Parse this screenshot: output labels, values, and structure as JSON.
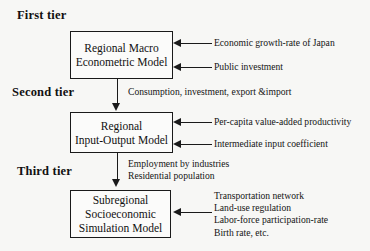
{
  "diagram": {
    "tiers": [
      {
        "id": "first",
        "label": "First tier"
      },
      {
        "id": "second",
        "label": "Second tier"
      },
      {
        "id": "third",
        "label": "Third tier"
      }
    ],
    "boxes": [
      {
        "id": "macro",
        "lines": [
          "Regional Macro",
          "Econometric Model"
        ]
      },
      {
        "id": "io",
        "lines": [
          "Regional",
          "Input-Output Model"
        ]
      },
      {
        "id": "sub",
        "lines": [
          "Subregional",
          "Socioeconomic",
          "Simulation Model"
        ]
      }
    ],
    "inputs": {
      "tier1": [
        {
          "id": "1a",
          "text": "Economic growth-rate of Japan"
        },
        {
          "id": "1b",
          "text": "Public investment"
        }
      ],
      "tier2": [
        {
          "id": "2a",
          "text": "Per-capita value-added productivity"
        },
        {
          "id": "2b",
          "text": "Intermediate input coefficient"
        }
      ],
      "tier3": [
        {
          "id": "3a",
          "text": "Transportation network"
        },
        {
          "id": "3b",
          "text": "Land-use regulation"
        },
        {
          "id": "3c",
          "text": "Labor-force participation-rate"
        },
        {
          "id": "3d",
          "text": "Birth rate, etc."
        }
      ]
    },
    "flows": [
      {
        "id": "flow-1-to-2",
        "from": "macro",
        "to": "io",
        "lines": [
          "Consumption, investment, export &import"
        ]
      },
      {
        "id": "flow-2-to-3",
        "from": "io",
        "to": "sub",
        "lines": [
          "Employment by industries",
          "Residential population"
        ]
      }
    ],
    "colors": {
      "ink": "#1a1a1a",
      "paper": "#f7f7f5",
      "box_fill": "#fbfbfa"
    }
  }
}
